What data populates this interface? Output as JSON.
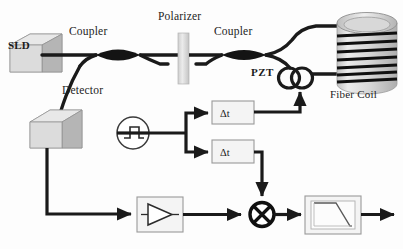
{
  "diagram": {
    "type": "optical-electronic-block-diagram",
    "background_color": "#fdfdfd",
    "line_color": "#1a1a1a",
    "box_fill": "#f2f2f2",
    "box_stroke": "#9a9a9a",
    "shade_light": "#e2e2e2",
    "shade_mid": "#c9c9c9",
    "shade_dark": "#a8a8a8"
  },
  "optical_path": {
    "source": {
      "label": "SLD",
      "name": "superluminescent-diode",
      "shape": "isometric-cube"
    },
    "coupler1": {
      "label": "Coupler",
      "name": "coupler-1",
      "shape": "fused-fiber-lens"
    },
    "polarizer": {
      "label": "Polarizer",
      "name": "polarizer",
      "shape": "vertical-bar"
    },
    "coupler2": {
      "label": "Coupler",
      "name": "coupler-2",
      "shape": "fused-fiber-lens"
    },
    "pzt": {
      "label": "PZT",
      "name": "piezoelectric-modulator",
      "shape": "fiber-loops",
      "loops": 2
    },
    "fiber_coil": {
      "label": "Fiber Coil",
      "name": "fiber-coil",
      "shape": "cylinder",
      "windings": 7
    },
    "detector": {
      "label": "Detector",
      "name": "photodetector",
      "shape": "isometric-cube"
    }
  },
  "electronics": {
    "oscillator": {
      "name": "square-wave-generator",
      "symbol": "square-wave-in-circle",
      "label": ""
    },
    "delay1": {
      "label": "Δt",
      "name": "delay-block-1"
    },
    "delay2": {
      "label": "Δt",
      "name": "delay-block-2"
    },
    "amplifier": {
      "name": "amplifier",
      "symbol": "triangle-right",
      "label": ""
    },
    "mixer": {
      "name": "mixer",
      "symbol": "circle-with-x",
      "label": ""
    },
    "lowpass": {
      "name": "low-pass-filter",
      "symbol": "falling-response-curve",
      "label": ""
    },
    "output": {
      "name": "output-arrow",
      "label": ""
    }
  }
}
